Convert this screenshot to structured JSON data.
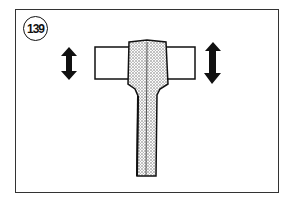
{
  "figure": {
    "number": "139",
    "colors": {
      "ink": "#111111",
      "stipple": "#bdbdbd",
      "background": "#ffffff"
    }
  }
}
